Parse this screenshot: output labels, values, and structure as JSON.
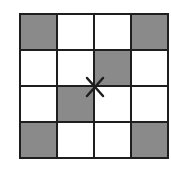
{
  "diagram": {
    "type": "grid",
    "rows": 4,
    "cols": 4,
    "colors": {
      "shaded": "#8a8a8a",
      "empty": "#ffffff",
      "line": "#1e1e1e"
    },
    "cells": [
      [
        1,
        0,
        0,
        1
      ],
      [
        0,
        0,
        1,
        0
      ],
      [
        0,
        1,
        0,
        0
      ],
      [
        1,
        0,
        0,
        1
      ]
    ],
    "marker": {
      "symbol": "X",
      "position": "center-intersection"
    }
  }
}
